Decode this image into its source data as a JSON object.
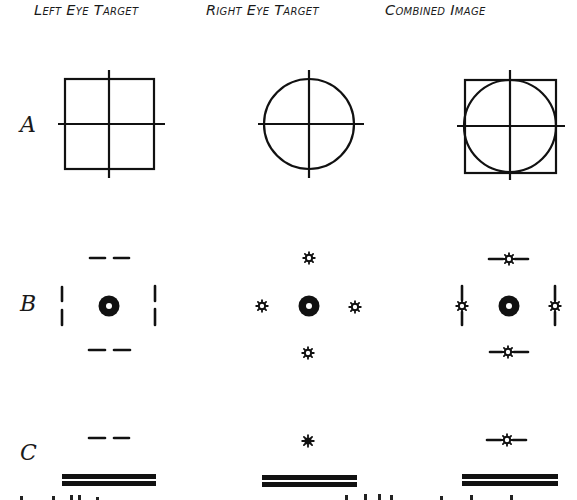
{
  "figure": {
    "columns": [
      {
        "label": "Left Eye Target"
      },
      {
        "label": "Right Eye Target"
      },
      {
        "label": "Combined Image"
      }
    ],
    "rows": [
      {
        "label": "A",
        "left": "square with cross",
        "right": "circle with cross",
        "combined": "circle inscribed in square with cross"
      },
      {
        "label": "B",
        "left": "dot with four pairs of dashes",
        "right": "dot with four star marks",
        "combined": "dot with four dashes each crossed by star"
      },
      {
        "label": "C",
        "left": "pair of dashes above double bar",
        "right": "star above double bar",
        "combined": "dashes with star above double bar"
      }
    ],
    "colors": {
      "ink": "#111111",
      "background": "#ffffff"
    }
  }
}
